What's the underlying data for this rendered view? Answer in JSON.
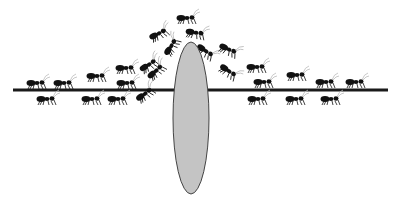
{
  "figure": {
    "colors": {
      "line": "#1a1a1a",
      "obstacle_fill": "#c4c4c4",
      "obstacle_stroke": "#444444",
      "ant": "#111111",
      "antenna": "#bbbbbb"
    },
    "path": {
      "x1": 13,
      "x2": 388,
      "y": 90
    },
    "obstacle": {
      "cx": 191,
      "cy": 118,
      "rx": 18,
      "ry": 76
    },
    "ants": [
      {
        "x": 38,
        "y": 83,
        "dir": 1,
        "rot": 0
      },
      {
        "x": 65,
        "y": 83,
        "dir": 1,
        "rot": 0
      },
      {
        "x": 98,
        "y": 76,
        "dir": 1,
        "rot": 0
      },
      {
        "x": 127,
        "y": 68,
        "dir": 1,
        "rot": 0
      },
      {
        "x": 128,
        "y": 83,
        "dir": 1,
        "rot": 0
      },
      {
        "x": 48,
        "y": 99,
        "dir": 1,
        "rot": 0
      },
      {
        "x": 93,
        "y": 99,
        "dir": 1,
        "rot": 0
      },
      {
        "x": 119,
        "y": 99,
        "dir": 1,
        "rot": 0
      },
      {
        "x": 146,
        "y": 93,
        "dir": 1,
        "rot": -35
      },
      {
        "x": 150,
        "y": 64,
        "dir": 1,
        "rot": -30
      },
      {
        "x": 157,
        "y": 70,
        "dir": 1,
        "rot": -40
      },
      {
        "x": 160,
        "y": 33,
        "dir": 1,
        "rot": -25
      },
      {
        "x": 172,
        "y": 45,
        "dir": 1,
        "rot": -55
      },
      {
        "x": 188,
        "y": 18,
        "dir": 1,
        "rot": 0
      },
      {
        "x": 197,
        "y": 33,
        "dir": 1,
        "rot": 10
      },
      {
        "x": 207,
        "y": 52,
        "dir": 1,
        "rot": 35
      },
      {
        "x": 230,
        "y": 50,
        "dir": 1,
        "rot": 25
      },
      {
        "x": 230,
        "y": 72,
        "dir": 1,
        "rot": 35
      },
      {
        "x": 258,
        "y": 67,
        "dir": 1,
        "rot": 0
      },
      {
        "x": 265,
        "y": 82,
        "dir": 1,
        "rot": 0
      },
      {
        "x": 298,
        "y": 75,
        "dir": 1,
        "rot": 0
      },
      {
        "x": 327,
        "y": 82,
        "dir": 1,
        "rot": 0
      },
      {
        "x": 357,
        "y": 82,
        "dir": 1,
        "rot": 0
      },
      {
        "x": 259,
        "y": 99,
        "dir": 1,
        "rot": 0
      },
      {
        "x": 297,
        "y": 99,
        "dir": 1,
        "rot": 0
      },
      {
        "x": 332,
        "y": 99,
        "dir": 1,
        "rot": 0
      }
    ]
  }
}
